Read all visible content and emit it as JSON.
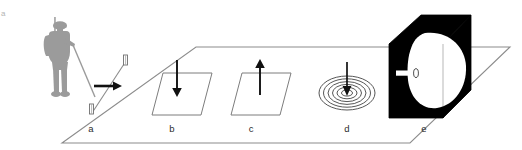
{
  "figure": {
    "tag": "a",
    "background_color": "#ffffff",
    "ground_line_color": "#8c8c8c",
    "ink_color": "#111111",
    "soldier_color": "#9b9b9b",
    "thin_line_color": "#8c8c8c"
  },
  "ground_plane": {
    "name": "perspective-ground-plane",
    "top_left": [
      62,
      143
    ],
    "points": "62,143 196,47 510,47 410,143"
  },
  "soldier": {
    "name": "soldier-figure",
    "label": "",
    "color": "#9b9b9b",
    "x": 40,
    "y": 16,
    "width": 40,
    "height": 84
  },
  "panels": [
    {
      "id": "a",
      "label": "a",
      "label_x": 91,
      "label_y": 132,
      "icon": "tilted-rod-with-end-caps-and-horizontal-arrow",
      "arrow_direction": "right",
      "arrow_color": "#111111"
    },
    {
      "id": "b",
      "label": "b",
      "label_x": 172,
      "label_y": 132,
      "icon": "ground-patch-parallelogram-with-down-arrow",
      "arrow_direction": "down",
      "arrow_color": "#111111"
    },
    {
      "id": "c",
      "label": "c",
      "label_x": 251,
      "label_y": 132,
      "icon": "ground-patch-parallelogram-with-up-arrow",
      "arrow_direction": "up",
      "arrow_color": "#111111"
    },
    {
      "id": "d",
      "label": "d",
      "label_x": 347,
      "label_y": 132,
      "icon": "concentric-ellipse-coil-with-down-arrow",
      "arrow_direction": "down",
      "rings": 6,
      "arrow_color": "#111111"
    },
    {
      "id": "e",
      "label": "e",
      "label_x": 424,
      "label_y": 132,
      "icon": "black-cube-with-white-blob-and-probe",
      "box_color": "#000000",
      "blob_color": "#ffffff",
      "probe_color": "#ffffff"
    }
  ]
}
